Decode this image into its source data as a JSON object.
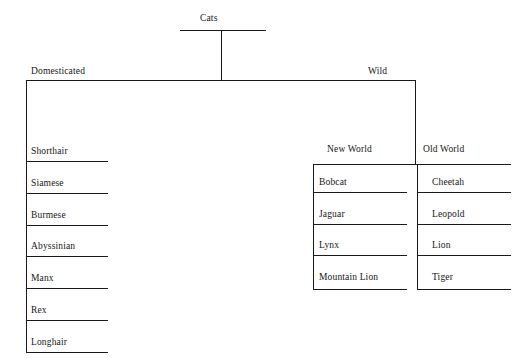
{
  "diagram": {
    "title": "Cats",
    "root": {
      "label": "Cats"
    },
    "level1": [
      {
        "label": "Domesticated"
      },
      {
        "label": "Wild"
      }
    ],
    "level2": [
      {
        "label": "New World"
      },
      {
        "label": "Old World"
      }
    ],
    "domesticated_breeds": [
      {
        "label": "Shorthair"
      },
      {
        "label": "Siamese"
      },
      {
        "label": "Burmese"
      },
      {
        "label": "Abyssinian"
      },
      {
        "label": "Manx"
      },
      {
        "label": "Rex"
      },
      {
        "label": "Longhair"
      }
    ],
    "new_world_species": [
      {
        "label": "Bobcat"
      },
      {
        "label": "Jaguar"
      },
      {
        "label": "Lynx"
      },
      {
        "label": "Mountain Lion"
      }
    ],
    "old_world_species": [
      {
        "label": "Cheetah"
      },
      {
        "label": "Leopold"
      },
      {
        "label": "Lion"
      },
      {
        "label": "Tiger"
      }
    ],
    "colors": {
      "line": "#1a1a1a",
      "text": "#161616",
      "background": "#ffffff"
    }
  }
}
